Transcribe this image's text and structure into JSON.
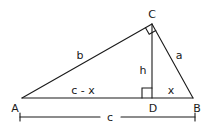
{
  "diagram": {
    "type": "right-triangle-with-altitude",
    "vertices": {
      "A": "A",
      "B": "B",
      "C": "C",
      "D": "D"
    },
    "sides": {
      "b": "b",
      "a": "a",
      "h": "h",
      "c_minus_x": "c - x",
      "x": "x",
      "c": "c"
    },
    "right_angles": [
      "C",
      "D"
    ],
    "colors": {
      "stroke": "#1a1a1a",
      "background": "#ffffff"
    }
  }
}
